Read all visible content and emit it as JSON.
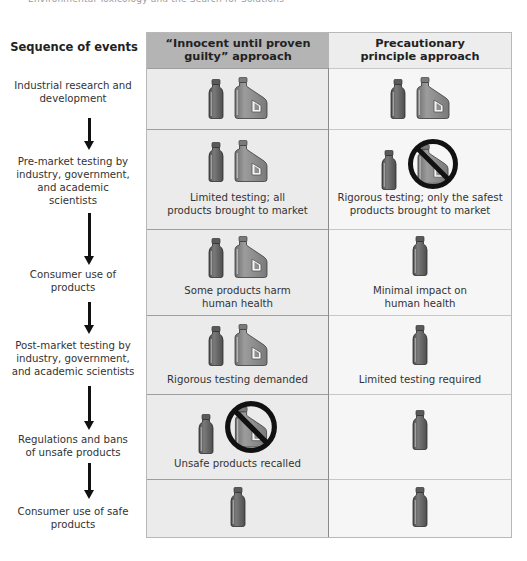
{
  "page_header": "Environmental Toxicology and the Search for Solutions",
  "sequence_title": "Sequence of events",
  "columns": [
    {
      "id": "innocent",
      "label_line1": "“Innocent until proven",
      "label_line2": "guilty” approach",
      "bg": "#b4b4b4"
    },
    {
      "id": "precautionary",
      "label_line1": "Precautionary",
      "label_line2": "principle approach",
      "bg": "#ededed"
    }
  ],
  "colors": {
    "bottle_fill": "#6b6b6b",
    "jug_fill": "#8c8c8c",
    "ban_stroke": "#111111",
    "arrow": "#111111",
    "left_cell_bg": "#ebebeb",
    "right_cell_bg": "#f6f6f6"
  },
  "steps": [
    {
      "label_lines": [
        "Industrial research and",
        "development"
      ]
    },
    {
      "label_lines": [
        "Pre-market testing by",
        "industry, government,",
        "and academic",
        "scientists"
      ]
    },
    {
      "label_lines": [
        "Consumer use of",
        "products"
      ]
    },
    {
      "label_lines": [
        "Post-market testing by",
        "industry, government,",
        "and academic scientists"
      ]
    },
    {
      "label_lines": [
        "Regulations and bans",
        "of unsafe products"
      ]
    },
    {
      "label_lines": [
        "Consumer use of safe",
        "products"
      ]
    }
  ],
  "rows": [
    {
      "innocent": {
        "icons": [
          "bottle-icon",
          "jug-icon"
        ],
        "caption_lines": []
      },
      "precautionary": {
        "icons": [
          "bottle-icon",
          "jug-icon"
        ],
        "caption_lines": []
      }
    },
    {
      "innocent": {
        "icons": [
          "bottle-icon",
          "jug-icon"
        ],
        "caption_lines": [
          "Limited testing; all",
          "products brought to market"
        ]
      },
      "precautionary": {
        "icons": [
          "bottle-icon",
          "banned-jug-icon"
        ],
        "caption_lines": [
          "Rigorous testing; only the safest",
          "products brought to market"
        ]
      }
    },
    {
      "innocent": {
        "icons": [
          "bottle-icon",
          "jug-icon"
        ],
        "caption_lines": [
          "Some products harm",
          "human health"
        ]
      },
      "precautionary": {
        "icons": [
          "bottle-icon"
        ],
        "caption_lines": [
          "Minimal impact on",
          "human health"
        ]
      }
    },
    {
      "innocent": {
        "icons": [
          "bottle-icon",
          "jug-icon"
        ],
        "caption_lines": [
          "Rigorous testing demanded"
        ]
      },
      "precautionary": {
        "icons": [
          "bottle-icon"
        ],
        "caption_lines": [
          "Limited testing required"
        ]
      }
    },
    {
      "innocent": {
        "icons": [
          "bottle-icon",
          "banned-jug-icon"
        ],
        "caption_lines": [
          "Unsafe products recalled"
        ]
      },
      "precautionary": {
        "icons": [
          "bottle-icon"
        ],
        "caption_lines": []
      }
    },
    {
      "innocent": {
        "icons": [
          "bottle-icon"
        ],
        "caption_lines": []
      },
      "precautionary": {
        "icons": [
          "bottle-icon"
        ],
        "caption_lines": []
      }
    }
  ]
}
